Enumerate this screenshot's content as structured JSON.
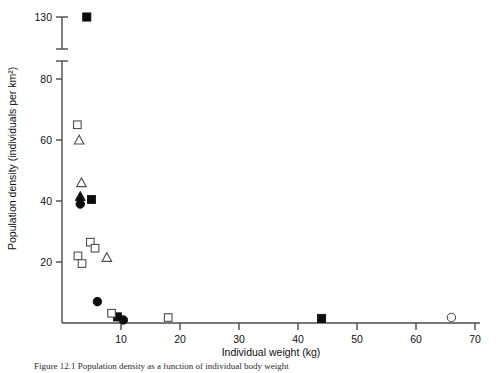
{
  "chart_data": {
    "type": "scatter",
    "title": "",
    "xlabel": "Individual weight (kg)",
    "ylabel": "Population density (individuals per km²)",
    "xlim": [
      0,
      70
    ],
    "ylim": [
      0,
      85
    ],
    "xticks": [
      10,
      20,
      30,
      40,
      50,
      60,
      70
    ],
    "xticklabels": [
      "10",
      "20",
      "30",
      "40",
      "50",
      "60",
      "70"
    ],
    "yticks": [
      20,
      40,
      60,
      80
    ],
    "yticklabels": [
      "20",
      "40",
      "60",
      "80"
    ],
    "y_break": {
      "present": true,
      "upper_tick": 130,
      "upper_tick_label": "130",
      "note": "axis broken between 80 and 130"
    },
    "grid": false,
    "legend_position": "none",
    "series": [
      {
        "name": "filled-square",
        "marker": "filled square",
        "points": [
          {
            "x": 4.2,
            "y": 130
          },
          {
            "x": 5.0,
            "y": 40.5
          },
          {
            "x": 9.4,
            "y": 2.0
          },
          {
            "x": 44.0,
            "y": 1.5
          }
        ]
      },
      {
        "name": "open-square",
        "marker": "open square",
        "points": [
          {
            "x": 2.6,
            "y": 65.0
          },
          {
            "x": 4.8,
            "y": 26.5
          },
          {
            "x": 5.6,
            "y": 24.5
          },
          {
            "x": 2.7,
            "y": 22.0
          },
          {
            "x": 3.4,
            "y": 19.5
          },
          {
            "x": 8.4,
            "y": 3.2
          },
          {
            "x": 18.0,
            "y": 1.8
          }
        ]
      },
      {
        "name": "open-triangle",
        "marker": "open triangle",
        "points": [
          {
            "x": 2.9,
            "y": 60.0
          },
          {
            "x": 3.3,
            "y": 46.0
          },
          {
            "x": 7.6,
            "y": 21.5
          }
        ]
      },
      {
        "name": "filled-circle",
        "marker": "filled circle",
        "points": [
          {
            "x": 3.1,
            "y": 39.0
          },
          {
            "x": 6.0,
            "y": 7.0
          },
          {
            "x": 10.4,
            "y": 1.0
          }
        ]
      },
      {
        "name": "filled-triangle",
        "marker": "filled triangle",
        "points": [
          {
            "x": 3.1,
            "y": 41.5
          }
        ]
      },
      {
        "name": "open-circle",
        "marker": "open circle",
        "points": [
          {
            "x": 66.0,
            "y": 1.8
          }
        ]
      }
    ]
  },
  "caption": {
    "text": "Figure 12.1  Population density as a function of individual body weight"
  }
}
